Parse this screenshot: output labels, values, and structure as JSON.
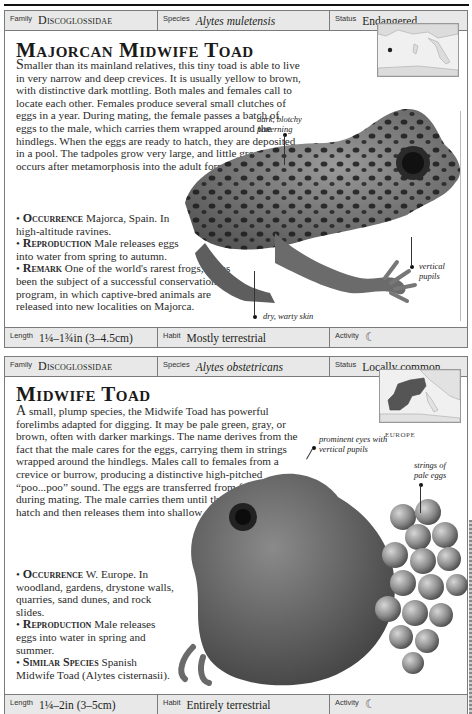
{
  "entries": [
    {
      "header": {
        "family_label": "Family",
        "family": "Discoglossidae",
        "species_label": "Species",
        "species": "Alytes muletensis",
        "status_label": "Status",
        "status": "Endangered"
      },
      "title": "Majorcan Midwife Toad",
      "description_lead": "S",
      "description": "maller than its mainland relatives, this tiny toad is able to live in very narrow and deep crevices. It is usually yellow to brown, with distinctive dark mottling. Both males and females call to locate each other. Females produce several small clutches of eggs in a year. During mating, the female passes a batch of eggs to the male, which carries them wrapped around the hindlegs. When the eggs are ready to hatch, they are deposited in a pool. The tadpoles grow very large, and little growth occurs after metamorphosis into the adult form.",
      "bullets": [
        {
          "label": "Occurrence",
          "text": " Majorca, Spain. In high-altitude ravines."
        },
        {
          "label": "Reproduction",
          "text": " Male releases eggs into water from spring to autumn."
        },
        {
          "label": "Remark",
          "text": " One of the world's rarest frogs, it has been the subject of a successful conservation program, in which captive-bred animals are released into new localities on Majorca."
        }
      ],
      "map_label": "MAJORCA",
      "annotations": [
        "dark, blotchy patterning",
        "vertical pupils",
        "dry, warty skin"
      ],
      "footer": {
        "length_label": "Length",
        "length": "1¼–1¾in (3–4.5cm)",
        "habit_label": "Habit",
        "habit": "Mostly terrestrial",
        "activity_label": "Activity",
        "activity_icon": "☾"
      }
    },
    {
      "header": {
        "family_label": "Family",
        "family": "Discoglossidae",
        "species_label": "Species",
        "species": "Alytes obstetricans",
        "status_label": "Status",
        "status": "Locally common"
      },
      "title": "Midwife Toad",
      "description_lead": "A",
      "description": " small, plump species, the Midwife Toad has powerful forelimbs adapted for digging. It may be pale green, gray, or brown, often with darker markings. The name derives from the fact that the male cares for the eggs, carrying them in strings wrapped around the hindlegs. Males call to females from a crevice or burrow, producing a distinctive high-pitched “poo...poo” sound. The eggs are transferred from female to male during mating. The male carries them until they are ready to hatch and then releases them into shallow water.",
      "bullets": [
        {
          "label": "Occurrence",
          "text": " W. Europe. In woodland, gardens, drystone walls, quarries, sand dunes, and rock slides."
        },
        {
          "label": "Reproduction",
          "text": " Male releases eggs into water in spring and summer."
        },
        {
          "label": "Similar Species",
          "text": " Spanish Midwife Toad (Alytes cisternasii)."
        }
      ],
      "map_label": "EUROPE",
      "annotations": [
        "prominent eyes with vertical pupils",
        "strings of pale eggs"
      ],
      "footer": {
        "length_label": "Length",
        "length": "1¼–2in (3–5cm)",
        "habit_label": "Habit",
        "habit": "Entirely terrestrial",
        "activity_label": "Activity",
        "activity_icon": "☾"
      }
    }
  ]
}
